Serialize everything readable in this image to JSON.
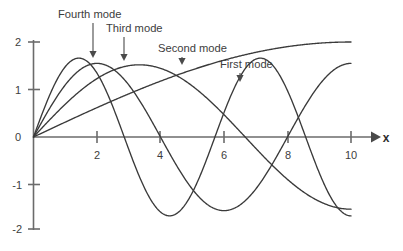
{
  "chart_data": {
    "type": "line",
    "title": "",
    "subtitle": "",
    "xlabel": "x",
    "ylabel": "",
    "xlim": [
      0,
      10.6
    ],
    "ylim": [
      -2,
      2
    ],
    "grid": false,
    "legend": "none",
    "x_ticks": [
      2,
      4,
      6,
      8,
      10
    ],
    "x_tick_labels": [
      "2",
      "4",
      "6",
      "8",
      "10"
    ],
    "y_ticks": [
      2,
      1,
      0,
      -1,
      -2
    ],
    "y_tick_labels": [
      "2",
      "1",
      "0",
      "-1",
      "-2"
    ],
    "series": [
      {
        "name": "First mode",
        "amplitude": 2.0,
        "half_waves": 0.5,
        "description": "sin(pi*x/20) scaled to 2.0 at x=10, monotonically increasing",
        "x": [
          0,
          0.5,
          1,
          1.5,
          2,
          2.5,
          3,
          3.5,
          4,
          4.5,
          5,
          5.5,
          6,
          6.5,
          7,
          7.5,
          8,
          8.5,
          9,
          9.5,
          10
        ],
        "values": [
          0,
          0.157,
          0.313,
          0.468,
          0.618,
          0.765,
          0.908,
          1.045,
          1.176,
          1.3,
          1.414,
          1.521,
          1.618,
          1.705,
          1.782,
          1.848,
          1.902,
          1.945,
          1.975,
          1.994,
          2.0
        ]
      },
      {
        "name": "Second mode",
        "amplitude": 1.52,
        "half_waves": 1.5,
        "description": "sin(3*pi*x/20) scaled to amplitude 1.52, peak near x=3.33, zero at x=6.67",
        "x": [
          0,
          0.5,
          1,
          1.5,
          2,
          2.5,
          3,
          3.5,
          4,
          4.5,
          5,
          5.5,
          6,
          6.5,
          7,
          7.5,
          8,
          8.5,
          9,
          9.5,
          10
        ],
        "values": [
          0,
          0.356,
          0.69,
          0.983,
          1.22,
          1.388,
          1.478,
          1.486,
          1.413,
          1.264,
          1.075,
          0.808,
          0.47,
          0.119,
          -0.238,
          -0.582,
          -0.895,
          -1.163,
          -1.372,
          -1.511,
          -1.52
        ]
      },
      {
        "name": "Third mode",
        "amplitude": 1.55,
        "half_waves": 2.5,
        "description": "sin(5*pi*x/20) scaled to amplitude 1.55, peak near x=2, zero at x=4, trough near x=6, zero at x=8",
        "x": [
          0,
          0.5,
          1,
          1.5,
          2,
          2.5,
          3,
          3.5,
          4,
          4.5,
          5,
          5.5,
          6,
          6.5,
          7,
          7.5,
          8,
          8.5,
          9,
          9.5,
          10
        ],
        "values": [
          0,
          0.593,
          1.096,
          1.432,
          1.55,
          1.432,
          1.096,
          0.593,
          0,
          -0.593,
          -1.096,
          -1.432,
          -1.55,
          -1.432,
          -1.096,
          -0.593,
          0,
          0.593,
          1.096,
          1.432,
          1.55
        ]
      },
      {
        "name": "Fourth mode",
        "amplitude": 1.66,
        "half_waves": 3.5,
        "description": "sin(7*pi*x/20) scaled to amplitude 1.66, first peak near x=1.9",
        "x": [
          0,
          0.5,
          1,
          1.5,
          2,
          2.5,
          3,
          3.5,
          4,
          4.5,
          5,
          5.5,
          6,
          6.5,
          7,
          7.5,
          8,
          8.5,
          9,
          9.5,
          10
        ],
        "values": [
          0,
          0.729,
          1.3,
          1.598,
          1.62,
          1.37,
          0.9,
          0.3,
          -0.36,
          -0.95,
          -1.39,
          -1.63,
          -1.62,
          -1.37,
          -0.92,
          -0.32,
          0.34,
          0.94,
          1.38,
          1.63,
          1.63
        ]
      }
    ],
    "annotations": [
      {
        "label": "Fourth mode",
        "points_to_series": "Fourth mode",
        "x": 1.88,
        "y": 1.62
      },
      {
        "label": "Third mode",
        "points_to_series": "Third mode",
        "x": 2.86,
        "y": 1.55
      },
      {
        "label": "Second mode",
        "points_to_series": "Second mode",
        "x": 4.69,
        "y": 1.5
      },
      {
        "label": "First mode",
        "points_to_series": "First mode",
        "x": 6.5,
        "y": 1.19
      }
    ]
  },
  "colors": {
    "curve": "#3a3a3a",
    "axis": "#6b6b6b",
    "label": "#3d3d3d",
    "background": "#ffffff"
  }
}
